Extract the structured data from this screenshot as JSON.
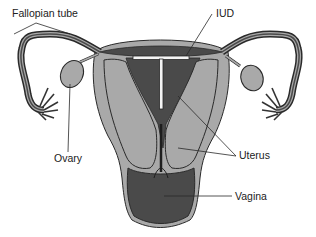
{
  "diagram": {
    "labels": {
      "fallopian_tube": "Fallopian tube",
      "iud": "IUD",
      "ovary": "Ovary",
      "uterus": "Uterus",
      "vagina": "Vagina"
    },
    "colors": {
      "tissue_light": "#a9a9a9",
      "tissue_mid": "#8c8c8c",
      "tissue_dark": "#4a4a4a",
      "outline": "#2a2a2a",
      "iud": "#f4f4f4",
      "background": "#ffffff"
    }
  }
}
